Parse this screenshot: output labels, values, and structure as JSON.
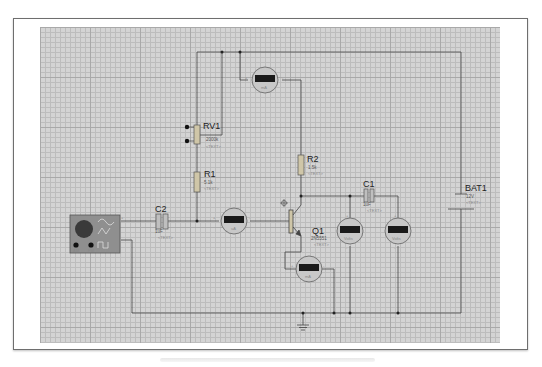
{
  "diagram": {
    "type": "circuit-schematic",
    "components": {
      "rv1": {
        "ref": "RV1",
        "value": "2000k",
        "text": "<TEXT>"
      },
      "r1": {
        "ref": "R1",
        "value": "5.1k",
        "text": "<TEXT>"
      },
      "r2": {
        "ref": "R2",
        "value": "1.5k",
        "text": "<TEXT>"
      },
      "c1": {
        "ref": "C1",
        "value": "1uF",
        "text": "<TEXT>"
      },
      "c2": {
        "ref": "C2",
        "value": "1uF",
        "text": "<TEXT>"
      },
      "q1": {
        "ref": "Q1",
        "value": "2N5551",
        "text": "<TEXT>"
      },
      "bat1": {
        "ref": "BAT1",
        "value": "12V",
        "text": "<TEXT>"
      },
      "signal_generator": {
        "label_a": "AM",
        "label_b": "FM",
        "plus": "+",
        "minus": "-"
      }
    },
    "meters": {
      "m_top": {
        "unit": "mA",
        "plus": "+",
        "minus": "-"
      },
      "m_base": {
        "unit": "uA",
        "plus": "+",
        "minus": "-"
      },
      "m_emitter": {
        "unit": "mA",
        "plus": "+",
        "minus": "-"
      },
      "m_volt1": {
        "unit": "Volts",
        "plus": "+",
        "minus": "-"
      },
      "m_volt2": {
        "unit": "Volts",
        "plus": "+",
        "minus": "-"
      }
    }
  }
}
